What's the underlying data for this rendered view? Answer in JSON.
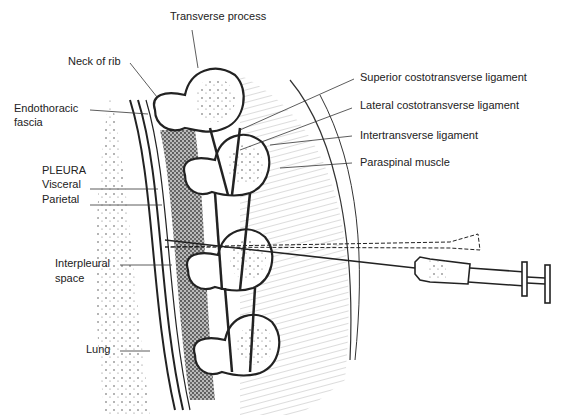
{
  "figure": {
    "labels": {
      "transverse_process": "Transverse process",
      "neck_of_rib": "Neck of rib",
      "endothoracic_1": "Endothoracic",
      "endothoracic_2": "fascia",
      "pleura": "PLEURA",
      "visceral": "Visceral",
      "parietal": "Parietal",
      "interpleural_1": "Interpleural",
      "interpleural_2": "space",
      "lung": "Lung",
      "superior_ligament": "Superior costotransverse ligament",
      "lateral_ligament": "Lateral costotransverse ligament",
      "intertransverse_ligament": "Intertransverse ligament",
      "paraspinal_muscle": "Paraspinal muscle"
    },
    "colors": {
      "line": "#222222",
      "stipple": "#555555",
      "background": "#ffffff"
    }
  }
}
